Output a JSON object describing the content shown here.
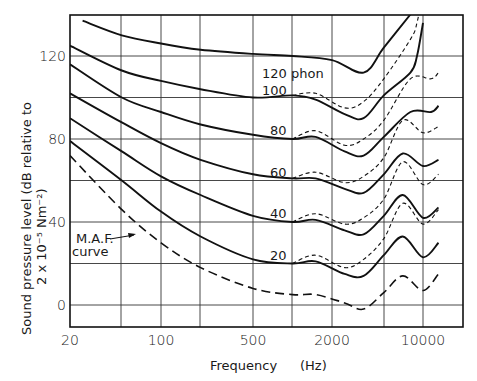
{
  "chart_data": {
    "type": "line",
    "title": "",
    "xlabel": "Frequency",
    "xunit": "(Hz)",
    "ylabel_line1": "Sound pressure level (dB relative to",
    "ylabel_line2": "2 x 10⁻⁵ Nm⁻²)",
    "xscale": "log",
    "x_ticks": [
      "20",
      "100",
      "500",
      "2000",
      "10000"
    ],
    "y_ticks": [
      "0",
      "40",
      "80",
      "120"
    ],
    "ylim": [
      -7,
      138
    ],
    "xlim": [
      20,
      16000
    ],
    "grid": true,
    "annotations": [
      {
        "text": "120 phon",
        "ref": "120"
      },
      {
        "text": "100",
        "ref": "100"
      },
      {
        "text": "80",
        "ref": "80"
      },
      {
        "text": "60",
        "ref": "60"
      },
      {
        "text": "40",
        "ref": "40"
      },
      {
        "text": "20",
        "ref": "20"
      },
      {
        "text": "M.A.F.",
        "ref": "maf"
      },
      {
        "text": "curve",
        "ref": "maf"
      }
    ],
    "series": [
      {
        "name": "120 phon",
        "style": "solid",
        "freq": [
          25,
          50,
          100,
          200,
          500,
          1000,
          2000,
          3500,
          5000,
          8000
        ],
        "db": [
          137,
          130,
          126,
          123,
          121,
          120,
          118,
          112,
          124,
          140
        ]
      },
      {
        "name": "100 phon",
        "style": "solid",
        "freq": [
          20,
          50,
          100,
          200,
          500,
          1000,
          1500,
          2500,
          3500,
          5000,
          8000,
          9000,
          10000
        ],
        "db": [
          125,
          113,
          108,
          104,
          100,
          101,
          99,
          92,
          90,
          101,
          112,
          120,
          136
        ]
      },
      {
        "name": "80 phon",
        "style": "solid",
        "freq": [
          20,
          50,
          100,
          200,
          500,
          1000,
          1500,
          2500,
          3500,
          5000,
          8000,
          11000,
          12000
        ],
        "db": [
          116,
          100,
          93,
          87,
          82,
          80,
          81,
          74,
          72,
          81,
          93,
          93,
          96
        ]
      },
      {
        "name": "60 phon",
        "style": "solid",
        "freq": [
          20,
          50,
          100,
          200,
          500,
          1000,
          1500,
          2500,
          3500,
          5000,
          7000,
          10000,
          12000
        ],
        "db": [
          102,
          88,
          78,
          70,
          63,
          61,
          61,
          56,
          54,
          63,
          73,
          67,
          70
        ]
      },
      {
        "name": "40 phon",
        "style": "solid",
        "freq": [
          20,
          50,
          100,
          200,
          500,
          1000,
          1500,
          2500,
          3500,
          5000,
          7000,
          10000,
          12000
        ],
        "db": [
          90,
          74,
          62,
          53,
          43,
          40,
          41,
          36,
          34,
          43,
          53,
          42,
          47
        ]
      },
      {
        "name": "20 phon",
        "style": "solid",
        "freq": [
          20,
          50,
          100,
          200,
          500,
          1000,
          1500,
          2500,
          3500,
          5000,
          7000,
          10000,
          12000
        ],
        "db": [
          79,
          60,
          45,
          33,
          22,
          20,
          21,
          15,
          14,
          24,
          33,
          23,
          30
        ]
      },
      {
        "name": "M.A.F. curve",
        "style": "dashed",
        "freq": [
          20,
          50,
          100,
          200,
          500,
          1000,
          1500,
          2500,
          3500,
          5000,
          7000,
          10000,
          12000
        ],
        "db": [
          72,
          46,
          30,
          18,
          8,
          5,
          5,
          1,
          -2,
          6,
          14,
          7,
          15
        ]
      }
    ]
  }
}
